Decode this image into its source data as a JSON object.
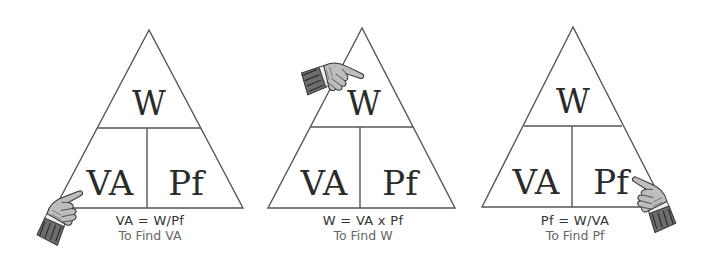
{
  "triangles": [
    {
      "top": "W",
      "bottom_left": "VA",
      "bottom_right": "Pf",
      "formula": "VA = W/Pf",
      "caption": "To Find VA",
      "pointer_target": "VA"
    },
    {
      "top": "W",
      "bottom_left": "VA",
      "bottom_right": "Pf",
      "formula": "W = VA x Pf",
      "caption": "To Find W",
      "pointer_target": "W"
    },
    {
      "top": "W",
      "bottom_left": "VA",
      "bottom_right": "Pf",
      "formula": "Pf = W/VA",
      "caption": "To Find Pf",
      "pointer_target": "Pf"
    }
  ],
  "colors": {
    "line": "#555555",
    "text": "#2a2a2a",
    "background": "#ffffff"
  }
}
